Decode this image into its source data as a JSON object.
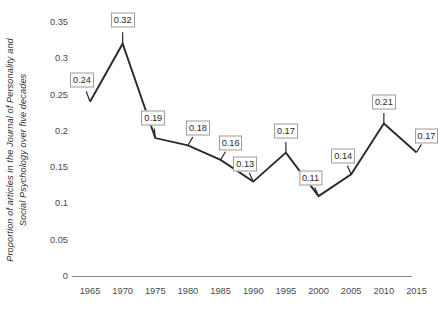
{
  "chart_data": {
    "type": "line",
    "title": "",
    "xlabel": "",
    "ylabel": "Proportion of articles in the Journal of Personality and Social Psychology over five decades",
    "ylabel_line1": "Proportion of articles in the Journal of Personality and",
    "ylabel_line2": "Social Psychology over five decades",
    "categories": [
      1965,
      1970,
      1975,
      1980,
      1985,
      1990,
      1995,
      2000,
      2005,
      2010,
      2015
    ],
    "x_tick_labels": [
      "1965",
      "1970",
      "1975",
      "1980",
      "1985",
      "1990",
      "1995",
      "2000",
      "2005",
      "2010",
      "2015"
    ],
    "values": [
      0.24,
      0.32,
      0.19,
      0.18,
      0.16,
      0.13,
      0.17,
      0.11,
      0.14,
      0.21,
      0.17
    ],
    "point_labels": [
      "0.24",
      "0.32",
      "0.19",
      "0.18",
      "0.16",
      "0.13",
      "0.17",
      "0.11",
      "0.14",
      "0.21",
      "0.17"
    ],
    "y_tick_values": [
      0,
      0.05,
      0.1,
      0.15,
      0.2,
      0.25,
      0.3,
      0.35
    ],
    "y_tick_labels": [
      "0",
      "0.05",
      "0.1",
      "0.15",
      "0.2",
      "0.25",
      "0.3",
      "0.35"
    ],
    "ylim": [
      0,
      0.35
    ],
    "xlim": [
      1962.5,
      2017.5
    ],
    "grid": false,
    "legend": false,
    "series_color": "#2b2b2b",
    "axis_color": "#8a8a8a",
    "label_box_border": "#9a9a9a",
    "background": "#ffffff"
  }
}
